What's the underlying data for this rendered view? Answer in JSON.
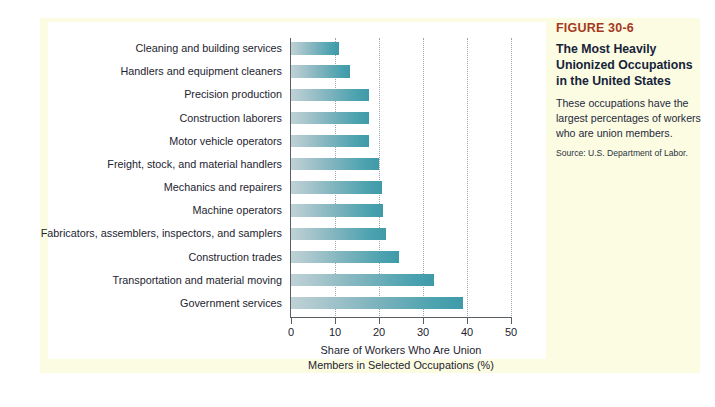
{
  "figure": {
    "number": "FIGURE 30-6",
    "title": "The Most Heavily Unionized Occupations in the United States",
    "title_lines": [
      "The Most Heavily",
      "Unionized Occupations",
      "in the United States"
    ],
    "description": "These occupations have the largest percentages of workers who are union members.",
    "source": "Source: U.S. Department of Labor."
  },
  "colors": {
    "figure_number": "#a6381f",
    "title": "#16233a",
    "bar_light": "#bed2d6",
    "bar_dark": "#3f9aa8",
    "panel_background": "#fcfce2",
    "card_background": "#ffffff",
    "axis": "#5a5f63",
    "gridline": "#9aa4ab"
  },
  "chart_data": {
    "type": "bar",
    "orientation": "horizontal",
    "title": "The Most Heavily Unionized Occupations in the United States",
    "xlabel": "Share of Workers Who Are Union Members in Selected Occupations (%)",
    "xlabel_lines": [
      "Share of Workers Who Are Union",
      "Members in Selected Occupations (%)"
    ],
    "ylabel": "",
    "xlim": [
      0,
      50
    ],
    "xticks": [
      0,
      10,
      20,
      30,
      40,
      50
    ],
    "xtick_labels": [
      "0",
      "10",
      "20",
      "30",
      "40",
      "50"
    ],
    "grid": "vertical-dotted",
    "legend": "none",
    "categories": [
      "Cleaning and building services",
      "Handlers and equipment cleaners",
      "Precision production",
      "Construction laborers",
      "Motor vehicle operators",
      "Freight, stock, and material handlers",
      "Mechanics and repairers",
      "Machine operators",
      "Fabricators, assemblers, inspectors, and samplers",
      "Construction trades",
      "Transportation and material moving",
      "Government services"
    ],
    "values": [
      11,
      13.5,
      17.7,
      17.7,
      17.8,
      20,
      20.6,
      21,
      21.5,
      24.5,
      32.5,
      39
    ],
    "source": "U.S. Department of Labor"
  }
}
